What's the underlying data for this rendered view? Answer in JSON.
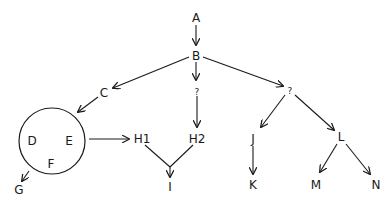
{
  "diagram": {
    "type": "tree",
    "nodes": {
      "A": "A",
      "B": "B",
      "C": "C",
      "Q1": "?",
      "Q2": "?",
      "D": "D",
      "E": "E",
      "F": "F",
      "G": "G",
      "H1": "H1",
      "H2": "H2",
      "I": "I",
      "J": "J",
      "K": "K",
      "L": "L",
      "M": "M",
      "N": "N"
    },
    "edges": [
      {
        "from": "A",
        "to": "B",
        "bidirectional_arrow": true
      },
      {
        "from": "B",
        "to": "C"
      },
      {
        "from": "B",
        "to": "Q1"
      },
      {
        "from": "B",
        "to": "Q2"
      },
      {
        "from": "C",
        "to": "DEF-circle"
      },
      {
        "from": "Q1",
        "to": "H2"
      },
      {
        "from": "DEF-circle",
        "to": "H1"
      },
      {
        "from": "DEF-circle",
        "to": "G"
      },
      {
        "from": "H1",
        "to": "I"
      },
      {
        "from": "H2",
        "to": "I"
      },
      {
        "from": "Q2",
        "to": "J"
      },
      {
        "from": "Q2",
        "to": "L"
      },
      {
        "from": "J",
        "to": "K"
      },
      {
        "from": "L",
        "to": "M"
      },
      {
        "from": "L",
        "to": "N"
      }
    ],
    "groups": [
      {
        "name": "DEF-circle",
        "members": [
          "D",
          "E",
          "F"
        ]
      }
    ]
  }
}
